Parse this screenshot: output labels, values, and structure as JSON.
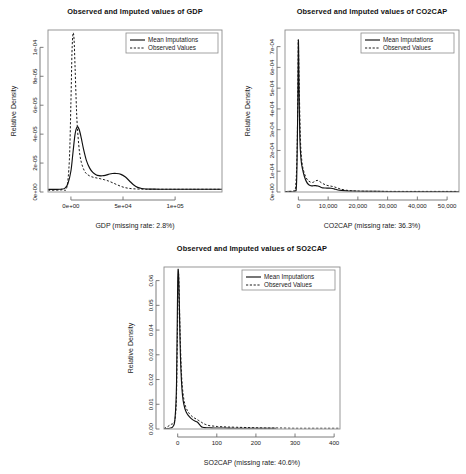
{
  "figure": {
    "legend": {
      "mean_label": "Mean Imputations",
      "observed_label": "Observed Values"
    },
    "shared_ylabel": "Relative Density"
  },
  "chart_data": [
    {
      "type": "line",
      "id": "gdp",
      "title": "Observed and Imputed values of GDP",
      "xlabel": "GDP (missing rate: 2.8%)",
      "ylabel": "Relative Density",
      "grid": false,
      "legend_position": "top-right",
      "xlim": [
        -22000,
        145000
      ],
      "ylim": [
        0,
        0.000112
      ],
      "xticks": [
        0,
        50000,
        100000
      ],
      "xticklabels": [
        "0e+00",
        "5e+04",
        "1e+05"
      ],
      "yticks": [
        0,
        2e-05,
        4e-05,
        6e-05,
        8e-05,
        0.0001
      ],
      "yticklabels": [
        "0e+00",
        "2e-05",
        "4e-05",
        "6e-05",
        "8e-05",
        "1e-04"
      ],
      "series": [
        {
          "name": "Mean Imputations",
          "style": "solid",
          "x": [
            -22000,
            -15000,
            -10000,
            -6000,
            -3000,
            0,
            2000,
            4000,
            6000,
            8000,
            10000,
            12000,
            15000,
            18000,
            21000,
            24000,
            27000,
            30000,
            33000,
            36000,
            40000,
            44000,
            48000,
            52000,
            56000,
            60000,
            64000,
            68000,
            72000,
            78000,
            85000,
            95000,
            110000,
            125000,
            145000
          ],
          "y": [
            1.8e-06,
            1.8e-06,
            1.9e-06,
            2.5e-06,
            5.5e-06,
            1.45e-05,
            2.75e-05,
            4e-05,
            4.5e-05,
            4.3e-05,
            3.7e-05,
            3e-05,
            2.15e-05,
            1.65e-05,
            1.35e-05,
            1.2e-05,
            1.13e-05,
            1.12e-05,
            1.15e-05,
            1.22e-05,
            1.28e-05,
            1.28e-05,
            1.22e-05,
            1.05e-05,
            7.8e-06,
            5e-06,
            3.2e-06,
            2.4e-06,
            2.1e-06,
            2e-06,
            1.9e-06,
            1.9e-06,
            1.9e-06,
            1.9e-06,
            1.9e-06
          ]
        },
        {
          "name": "Observed Values",
          "style": "dashed",
          "x": [
            -22000,
            -14000,
            -8000,
            -4000,
            -1500,
            0,
            1000,
            2000,
            3000,
            4000,
            5000,
            6000,
            8000,
            10000,
            13000,
            16000,
            20000,
            24000,
            28000,
            32000,
            36000,
            40000,
            45000,
            50000,
            55000,
            60000,
            66000,
            72000,
            80000,
            90000,
            105000,
            120000,
            145000
          ],
          "y": [
            1.2e-06,
            1.3e-06,
            1.6e-06,
            3e-06,
            2.2e-05,
            6.2e-05,
            9.6e-05,
            0.0001095,
            0.0001055,
            8.6e-05,
            6.4e-05,
            4.7e-05,
            2.9e-05,
            2.05e-05,
            1.45e-05,
            1.2e-05,
            1.05e-05,
            9.8e-06,
            9.2e-06,
            8.5e-06,
            7.6e-06,
            6.4e-06,
            4.8e-06,
            3.4e-06,
            2.6e-06,
            2.2e-06,
            2e-06,
            1.9e-06,
            1.9e-06,
            1.9e-06,
            1.9e-06,
            1.9e-06,
            1.9e-06
          ]
        }
      ]
    },
    {
      "type": "line",
      "id": "co2cap",
      "title": "Observed and Imputed values of CO2CAP",
      "xlabel": "CO2CAP (missing rate: 36.3%)",
      "ylabel": "Relative Density",
      "grid": false,
      "legend_position": "top-right",
      "xlim": [
        -4500,
        54000
      ],
      "ylim": [
        0,
        0.00078
      ],
      "xticks": [
        0,
        10000,
        20000,
        30000,
        40000,
        50000
      ],
      "xticklabels": [
        "0",
        "10,000",
        "20,000",
        "30,000",
        "40,000",
        "50,000"
      ],
      "yticks": [
        0,
        0.0001,
        0.0002,
        0.0003,
        0.0004,
        0.0005,
        0.0006,
        0.0007
      ],
      "yticklabels": [
        "0e+00",
        "1e-04",
        "2e-04",
        "3e-04",
        "4e-04",
        "5e-04",
        "6e-04",
        "7e-04"
      ],
      "series": [
        {
          "name": "Mean Imputations",
          "style": "solid",
          "x": [
            -4500,
            -2500,
            -1200,
            -600,
            -200,
            0,
            200,
            500,
            900,
            1400,
            2000,
            2700,
            3400,
            4200,
            5000,
            5800,
            6600,
            7400,
            8200,
            9000,
            10000,
            11000,
            12000,
            13000,
            14500,
            16000,
            18000,
            20000,
            23000,
            26000,
            30000,
            35000,
            40000,
            45000,
            50000,
            54000
          ],
          "y": [
            2.5e-06,
            2.8e-06,
            4e-06,
            5e-05,
            0.00042,
            0.00073,
            0.00052,
            0.00026,
            0.000155,
            0.00011,
            7.6e-05,
            5e-05,
            3.6e-05,
            3e-05,
            3e-05,
            3.1e-05,
            2.9e-05,
            2.4e-05,
            2e-05,
            1.9e-05,
            1.85e-05,
            1.8e-05,
            1.5e-05,
            1.1e-05,
            7.5e-06,
            5.5e-06,
            4.2e-06,
            3.5e-06,
            3e-06,
            2.8e-06,
            2.6e-06,
            2.5e-06,
            2.5e-06,
            2.5e-06,
            2.5e-06,
            2.5e-06
          ]
        },
        {
          "name": "Observed Values",
          "style": "dashed",
          "x": [
            -4500,
            -2800,
            -1600,
            -900,
            -400,
            -100,
            0,
            300,
            700,
            1200,
            1800,
            2500,
            3200,
            4000,
            4800,
            5600,
            6300,
            7000,
            7800,
            8600,
            9400,
            10200,
            11000,
            12000,
            13000,
            14000,
            15500,
            17000,
            19000,
            22000,
            26000,
            30000,
            35000,
            40000,
            45000,
            50000,
            54000
          ],
          "y": [
            2e-06,
            2.4e-06,
            5.5e-06,
            3e-05,
            0.00022,
            0.00064,
            0.000725,
            0.0005,
            0.00025,
            0.000145,
            0.0001,
            7.2e-05,
            5.6e-05,
            4.8e-05,
            4.6e-05,
            5.2e-05,
            5.6e-05,
            5.2e-05,
            4.4e-05,
            3.8e-05,
            3.3e-05,
            3e-05,
            2.8e-05,
            2.5e-05,
            2e-05,
            1.5e-05,
            1e-05,
            7e-06,
            5e-06,
            3.8e-06,
            3.2e-06,
            3e-06,
            2.8e-06,
            2.8e-06,
            2.8e-06,
            2.8e-06,
            2.8e-06
          ]
        }
      ]
    },
    {
      "type": "line",
      "id": "so2cap",
      "title": "Observed and Imputed values of SO2CAP",
      "xlabel": "SO2CAP (missing rate: 40.6%)",
      "ylabel": "Relative Density",
      "grid": false,
      "legend_position": "top-right",
      "xlim": [
        -35,
        415
      ],
      "ylim": [
        0,
        0.0655
      ],
      "xticks": [
        0,
        100,
        200,
        300,
        400
      ],
      "xticklabels": [
        "0",
        "100",
        "200",
        "300",
        "400"
      ],
      "yticks": [
        0,
        0.01,
        0.02,
        0.03,
        0.04,
        0.05,
        0.06
      ],
      "yticklabels": [
        "0.00",
        "0.01",
        "0.02",
        "0.03",
        "0.04",
        "0.05",
        "0.06"
      ],
      "series": [
        {
          "name": "Mean Imputations",
          "style": "solid",
          "x": [
            -35,
            -25,
            -18,
            -12,
            -7,
            -3,
            0,
            2,
            4,
            6,
            8,
            11,
            14,
            18,
            22,
            27,
            32,
            38,
            44,
            50,
            56,
            60,
            64,
            68,
            74,
            82,
            92,
            105,
            120,
            140,
            160,
            185,
            210,
            230,
            245,
            250
          ],
          "y": [
            0.0001,
            0.0002,
            0.0004,
            0.001,
            0.004,
            0.018,
            0.059,
            0.0635,
            0.052,
            0.036,
            0.025,
            0.016,
            0.0115,
            0.0085,
            0.0068,
            0.0055,
            0.0046,
            0.0038,
            0.0032,
            0.0028,
            0.0018,
            0.001,
            0.0007,
            0.0006,
            0.0005,
            0.0005,
            0.0004,
            0.0004,
            0.0004,
            0.0003,
            0.0003,
            0.0003,
            0.0003,
            0.0003,
            0.0003,
            0.0003
          ]
        },
        {
          "name": "Observed Values",
          "style": "dashed",
          "x": [
            -35,
            -26,
            -20,
            -15,
            -10,
            -6,
            -3,
            0,
            2,
            4,
            6,
            9,
            12,
            16,
            20,
            25,
            30,
            36,
            42,
            48,
            54,
            60,
            66,
            72,
            80,
            90,
            102,
            115,
            130,
            150,
            175,
            200,
            230,
            260,
            300,
            340,
            380,
            415
          ],
          "y": [
            0.0002,
            0.0009,
            0.0016,
            0.002,
            0.0024,
            0.005,
            0.014,
            0.046,
            0.0625,
            0.054,
            0.04,
            0.025,
            0.017,
            0.0118,
            0.0092,
            0.0074,
            0.0062,
            0.0052,
            0.0045,
            0.004,
            0.0034,
            0.0028,
            0.0022,
            0.0018,
            0.0014,
            0.0012,
            0.001,
            0.0009,
            0.0008,
            0.0007,
            0.0006,
            0.0005,
            0.0004,
            0.0004,
            0.0003,
            0.0003,
            0.0003,
            0.0003
          ]
        }
      ]
    }
  ]
}
